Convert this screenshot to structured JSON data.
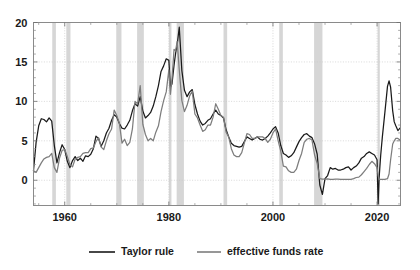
{
  "chart_data": {
    "type": "line",
    "title": "",
    "subtitle": "",
    "xlabel": "",
    "ylabel": "",
    "xlim": [
      1954.0,
      2024.5
    ],
    "ylim": [
      -3.2,
      20.0
    ],
    "grid": true,
    "yticks": [
      0,
      5,
      10,
      15,
      20
    ],
    "ytick_labels": [
      "0",
      "5",
      "10",
      "15",
      "20"
    ],
    "xticks": [
      1960,
      1980,
      2000,
      2020
    ],
    "xtick_labels": [
      "1960",
      "1980",
      "2000",
      "2020"
    ],
    "xminorticks": [
      1955,
      1965,
      1970,
      1975,
      1985,
      1990,
      1995,
      2005,
      2010,
      2015
    ],
    "legend_position": "below",
    "colors": {
      "taylor_rule": "#1a1a1a",
      "effective_funds_rate": "#7d7d7d",
      "recession_band": "#bdbdbd",
      "gridline": "#c9c9c9",
      "frame": "#8a8a8a",
      "text": "#1a1a1a",
      "background": "#ffffff"
    },
    "recessions": [
      {
        "start": 1957.6,
        "end": 1958.3
      },
      {
        "start": 1960.3,
        "end": 1961.1
      },
      {
        "start": 1969.9,
        "end": 1970.9
      },
      {
        "start": 1973.9,
        "end": 1975.2
      },
      {
        "start": 1980.0,
        "end": 1980.5
      },
      {
        "start": 1981.5,
        "end": 1982.9
      },
      {
        "start": 1990.5,
        "end": 1991.2
      },
      {
        "start": 2001.2,
        "end": 2001.9
      },
      {
        "start": 2007.9,
        "end": 2009.5
      },
      {
        "start": 2020.1,
        "end": 2020.4
      }
    ],
    "series": [
      {
        "name": "Taylor rule",
        "color": "#1a1a1a",
        "x": [
          1954.0,
          1954.5,
          1955.0,
          1955.5,
          1956.0,
          1956.5,
          1957.0,
          1957.5,
          1958.0,
          1958.5,
          1959.0,
          1959.5,
          1960.0,
          1960.5,
          1961.0,
          1961.5,
          1962.0,
          1962.5,
          1963.0,
          1963.5,
          1964.0,
          1964.5,
          1965.0,
          1965.5,
          1966.0,
          1966.5,
          1967.0,
          1967.5,
          1968.0,
          1968.5,
          1969.0,
          1969.5,
          1970.0,
          1970.5,
          1971.0,
          1971.5,
          1972.0,
          1972.5,
          1973.0,
          1973.5,
          1974.0,
          1974.5,
          1975.0,
          1975.5,
          1976.0,
          1976.5,
          1977.0,
          1977.5,
          1978.0,
          1978.5,
          1979.0,
          1979.5,
          1980.0,
          1980.3,
          1980.6,
          1981.0,
          1981.3,
          1981.6,
          1982.0,
          1982.5,
          1983.0,
          1983.5,
          1984.0,
          1984.5,
          1985.0,
          1985.5,
          1986.0,
          1986.5,
          1987.0,
          1987.5,
          1988.0,
          1988.5,
          1989.0,
          1989.5,
          1990.0,
          1990.5,
          1991.0,
          1991.5,
          1992.0,
          1992.5,
          1993.0,
          1993.5,
          1994.0,
          1994.5,
          1995.0,
          1995.5,
          1996.0,
          1996.5,
          1997.0,
          1997.5,
          1998.0,
          1998.5,
          1999.0,
          1999.5,
          2000.0,
          2000.5,
          2001.0,
          2001.5,
          2002.0,
          2002.5,
          2003.0,
          2003.5,
          2004.0,
          2004.5,
          2005.0,
          2005.5,
          2006.0,
          2006.5,
          2007.0,
          2007.5,
          2008.0,
          2008.5,
          2009.0,
          2009.5,
          2010.0,
          2010.5,
          2011.0,
          2011.5,
          2012.0,
          2012.5,
          2013.0,
          2013.5,
          2014.0,
          2014.5,
          2015.0,
          2015.5,
          2016.0,
          2016.5,
          2017.0,
          2017.5,
          2018.0,
          2018.5,
          2019.0,
          2019.5,
          2020.0,
          2020.2,
          2020.4,
          2020.7,
          2021.0,
          2021.5,
          2022.0,
          2022.3,
          2022.6,
          2023.0,
          2023.3,
          2023.6,
          2024.0,
          2024.4
        ],
        "y": [
          1.2,
          4.8,
          6.9,
          7.8,
          7.7,
          7.4,
          7.9,
          7.5,
          4.4,
          2.2,
          3.5,
          4.5,
          3.9,
          2.4,
          1.6,
          2.5,
          3.0,
          2.5,
          2.8,
          2.4,
          3.1,
          3.0,
          3.3,
          4.0,
          5.6,
          5.3,
          4.3,
          5.0,
          6.0,
          6.6,
          7.6,
          8.3,
          8.0,
          7.2,
          6.6,
          6.5,
          7.0,
          7.6,
          8.8,
          9.7,
          9.4,
          10.6,
          8.8,
          7.9,
          8.2,
          8.6,
          9.4,
          10.6,
          12.0,
          13.8,
          14.5,
          15.4,
          15.2,
          11.8,
          12.2,
          14.6,
          16.1,
          17.2,
          19.4,
          13.9,
          11.4,
          10.6,
          11.2,
          11.5,
          9.6,
          8.4,
          7.5,
          7.0,
          7.2,
          7.6,
          7.8,
          8.4,
          8.9,
          8.4,
          8.2,
          7.9,
          6.4,
          5.5,
          4.7,
          4.4,
          4.3,
          4.2,
          4.3,
          4.9,
          5.5,
          5.3,
          5.1,
          5.3,
          5.5,
          5.2,
          5.1,
          5.3,
          5.6,
          6.0,
          6.5,
          6.8,
          6.0,
          4.4,
          3.4,
          3.2,
          2.9,
          3.1,
          3.5,
          4.2,
          4.9,
          5.4,
          5.8,
          5.9,
          5.6,
          5.4,
          4.6,
          3.3,
          -0.6,
          -1.8,
          0.2,
          0.6,
          1.6,
          1.4,
          1.5,
          1.3,
          1.3,
          1.4,
          1.6,
          1.7,
          1.3,
          1.6,
          1.8,
          2.2,
          2.8,
          3.0,
          3.4,
          3.6,
          3.4,
          3.2,
          2.6,
          -3.0,
          0.4,
          3.2,
          5.4,
          8.6,
          11.9,
          12.6,
          11.8,
          8.8,
          7.4,
          6.9,
          6.3,
          6.6
        ]
      },
      {
        "name": "effective funds rate",
        "color": "#7d7d7d",
        "x": [
          1954.0,
          1954.5,
          1955.0,
          1955.5,
          1956.0,
          1956.5,
          1957.0,
          1957.5,
          1958.0,
          1958.5,
          1959.0,
          1959.5,
          1960.0,
          1960.5,
          1961.0,
          1961.5,
          1962.0,
          1962.5,
          1963.0,
          1963.5,
          1964.0,
          1964.5,
          1965.0,
          1965.5,
          1966.0,
          1966.5,
          1967.0,
          1967.5,
          1968.0,
          1968.5,
          1969.0,
          1969.5,
          1970.0,
          1970.5,
          1971.0,
          1971.5,
          1972.0,
          1972.5,
          1973.0,
          1973.5,
          1974.0,
          1974.5,
          1975.0,
          1975.5,
          1976.0,
          1976.5,
          1977.0,
          1977.5,
          1978.0,
          1978.5,
          1979.0,
          1979.5,
          1980.0,
          1980.3,
          1980.6,
          1981.0,
          1981.3,
          1981.6,
          1982.0,
          1982.5,
          1983.0,
          1983.5,
          1984.0,
          1984.5,
          1985.0,
          1985.5,
          1986.0,
          1986.5,
          1987.0,
          1987.5,
          1988.0,
          1988.5,
          1989.0,
          1989.5,
          1990.0,
          1990.5,
          1991.0,
          1991.5,
          1992.0,
          1992.5,
          1993.0,
          1993.5,
          1994.0,
          1994.5,
          1995.0,
          1995.5,
          1996.0,
          1996.5,
          1997.0,
          1997.5,
          1998.0,
          1998.5,
          1999.0,
          1999.5,
          2000.0,
          2000.5,
          2001.0,
          2001.5,
          2002.0,
          2002.5,
          2003.0,
          2003.5,
          2004.0,
          2004.5,
          2005.0,
          2005.5,
          2006.0,
          2006.5,
          2007.0,
          2007.5,
          2008.0,
          2008.5,
          2009.0,
          2009.5,
          2010.0,
          2010.5,
          2011.0,
          2011.5,
          2012.0,
          2012.5,
          2013.0,
          2013.5,
          2014.0,
          2014.5,
          2015.0,
          2015.5,
          2016.0,
          2016.5,
          2017.0,
          2017.5,
          2018.0,
          2018.5,
          2019.0,
          2019.5,
          2020.0,
          2020.2,
          2020.4,
          2020.7,
          2021.0,
          2021.5,
          2022.0,
          2022.3,
          2022.6,
          2023.0,
          2023.3,
          2023.6,
          2024.0,
          2024.4
        ],
        "y": [
          1.2,
          1.0,
          1.6,
          2.2,
          2.7,
          2.9,
          3.0,
          3.4,
          1.6,
          1.0,
          2.8,
          3.8,
          3.9,
          3.0,
          2.0,
          1.7,
          2.7,
          2.9,
          3.0,
          3.4,
          3.5,
          3.5,
          4.0,
          4.1,
          4.9,
          5.4,
          4.2,
          3.9,
          5.0,
          5.9,
          6.5,
          8.9,
          8.2,
          7.2,
          4.7,
          5.2,
          4.4,
          4.8,
          6.5,
          10.0,
          9.7,
          12.0,
          7.1,
          5.8,
          5.0,
          5.3,
          5.0,
          6.1,
          6.9,
          8.7,
          10.1,
          11.2,
          14.0,
          10.9,
          12.8,
          16.6,
          16.4,
          17.6,
          14.0,
          10.1,
          8.7,
          9.5,
          10.7,
          11.3,
          8.4,
          7.9,
          7.0,
          6.2,
          6.4,
          7.0,
          7.0,
          8.0,
          9.7,
          9.0,
          8.2,
          8.0,
          6.1,
          5.5,
          4.0,
          3.2,
          3.0,
          3.0,
          3.5,
          4.7,
          5.9,
          5.8,
          5.3,
          5.3,
          5.5,
          5.5,
          5.5,
          5.3,
          4.8,
          5.2,
          6.0,
          6.5,
          5.0,
          3.7,
          1.8,
          1.7,
          1.2,
          1.0,
          1.0,
          1.4,
          2.5,
          3.4,
          4.8,
          5.2,
          5.3,
          5.1,
          3.2,
          2.1,
          0.2,
          0.15,
          0.15,
          0.18,
          0.1,
          0.1,
          0.15,
          0.15,
          0.12,
          0.1,
          0.1,
          0.1,
          0.12,
          0.2,
          0.35,
          0.4,
          0.7,
          1.1,
          1.5,
          2.0,
          2.4,
          2.1,
          1.6,
          0.6,
          0.1,
          0.1,
          0.1,
          0.1,
          0.2,
          0.8,
          2.6,
          4.6,
          5.0,
          5.3,
          5.3,
          5.1
        ]
      }
    ]
  },
  "axes": {
    "y_tick_labels": [
      "20",
      "15",
      "10",
      "5",
      "0"
    ],
    "x_tick_labels": [
      "1960",
      "1980",
      "2000",
      "2020"
    ]
  },
  "legend": {
    "items": [
      {
        "label": "Taylor rule",
        "color": "#1a1a1a",
        "icon": "line-swatch-icon"
      },
      {
        "label": "effective funds rate",
        "color": "#7d7d7d",
        "icon": "line-swatch-icon"
      }
    ]
  }
}
